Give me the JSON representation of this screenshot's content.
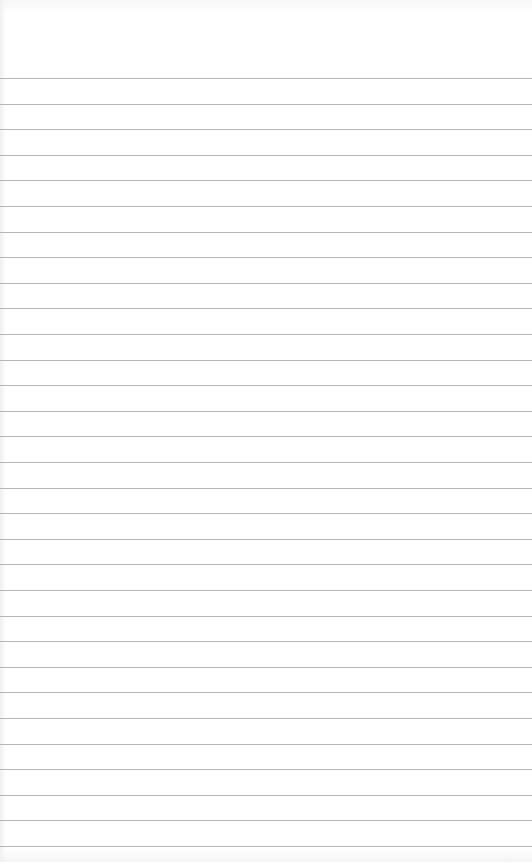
{
  "paper": {
    "type": "ruled-notepad-sheet",
    "background_color": "#ffffff",
    "rule_color": "#a9a9a9",
    "rule_count": 31,
    "first_rule_y": 78,
    "rule_spacing": 25.6
  }
}
